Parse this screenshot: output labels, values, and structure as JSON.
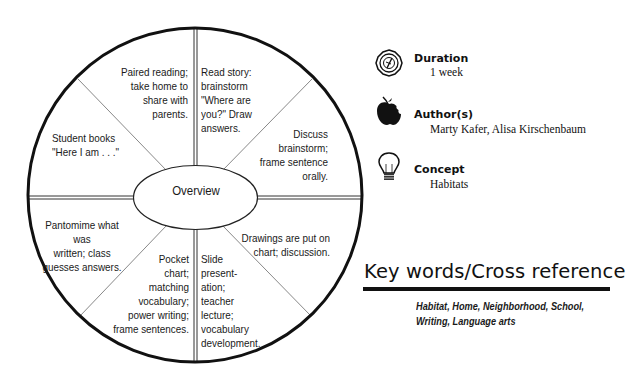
{
  "diagram": {
    "center_label": "Overview",
    "segments": [
      {
        "position": "top-left",
        "text": "Paired reading;\ntake home to\nshare with\nparents."
      },
      {
        "position": "top-right",
        "text": "Read story:\nbrainstorm\n\"Where are\nyou?\"  Draw\nanswers."
      },
      {
        "position": "right-upper",
        "text": "Discuss\nbrainstorm;\nframe sentence\norally."
      },
      {
        "position": "right-lower",
        "text": "Drawings are put on\nchart; discussion."
      },
      {
        "position": "bottom-right",
        "text": "Slide\npresent-\nation;\nteacher\nlecture;\nvocabulary\ndevelopment."
      },
      {
        "position": "bottom-left",
        "text": "Pocket\nchart;\nmatching\nvocabulary;\npower writing;\nframe sentences."
      },
      {
        "position": "left-lower",
        "text": "Pantomime what was\nwritten; class\nguesses answers."
      },
      {
        "position": "left-upper",
        "text": "Student books\n\"Here I am . . .\""
      }
    ]
  },
  "info": {
    "duration": {
      "icon": "clock-badge-icon",
      "title": "Duration",
      "value": "1 week"
    },
    "authors": {
      "icon": "apple-icon",
      "title": "Author(s)",
      "value": "Marty Kafer, Alisa Kirschenbaum"
    },
    "concept": {
      "icon": "lightbulb-icon",
      "title": "Concept",
      "value": "Habitats"
    }
  },
  "keywords": {
    "title": "Key words/Cross reference",
    "text": "Habitat, Home, Neighborhood, School, Writing, Language arts"
  }
}
